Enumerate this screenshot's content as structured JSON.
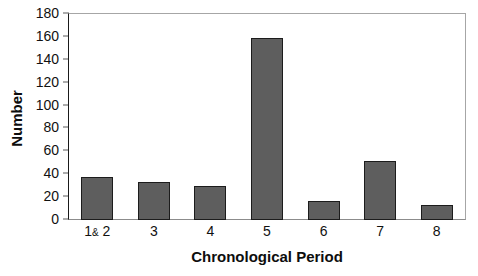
{
  "chart_data": {
    "type": "bar",
    "title": "",
    "xlabel": "Chronological Period",
    "ylabel": "Number",
    "categories": [
      "1& 2",
      "3",
      "4",
      "5",
      "6",
      "7",
      "8"
    ],
    "values": [
      38,
      33,
      30,
      159,
      17,
      52,
      13
    ],
    "series": [
      {
        "name": "Number",
        "values": [
          38,
          33,
          30,
          159,
          17,
          52,
          13
        ]
      }
    ],
    "ylim": [
      0,
      180
    ],
    "ytick_step": 20,
    "yticks": [
      0,
      20,
      40,
      60,
      80,
      100,
      120,
      140,
      160,
      180
    ],
    "ytick_labels": [
      "0",
      "20",
      "40",
      "60",
      "80",
      "100",
      "120",
      "140",
      "160",
      "180"
    ],
    "grid": false,
    "legend": false,
    "legend_position": "none",
    "bar_fill_color": "#5e5e5e",
    "bar_edge_color": "#1c1c1c",
    "axis_color": "#1a1a1a",
    "frame_color": "#a6a6a6",
    "background_color": "#ffffff",
    "text_color": "#111111"
  },
  "axes": {
    "y_title": "Number",
    "x_title": "Chronological Period"
  },
  "x_tick_parts": [
    {
      "number_before": "1",
      "amp": "&",
      "number_after": " 2"
    },
    {
      "number_before": "3",
      "amp": "",
      "number_after": ""
    },
    {
      "number_before": "4",
      "amp": "",
      "number_after": ""
    },
    {
      "number_before": "5",
      "amp": "",
      "number_after": ""
    },
    {
      "number_before": "6",
      "amp": "",
      "number_after": ""
    },
    {
      "number_before": "7",
      "amp": "",
      "number_after": ""
    },
    {
      "number_before": "8",
      "amp": "",
      "number_after": ""
    }
  ]
}
